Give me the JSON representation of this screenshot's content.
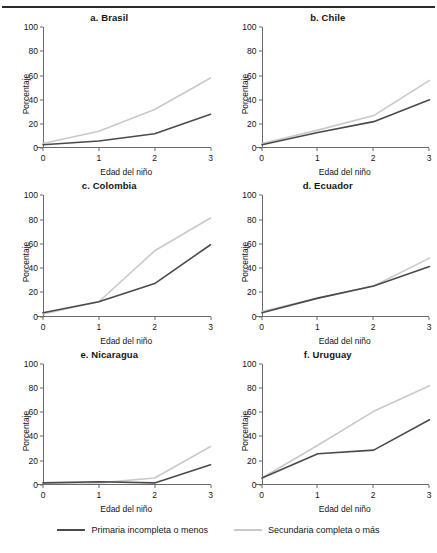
{
  "figure": {
    "ylabel": "Porcentaje",
    "xlabel": "Edad del niño",
    "yticks": [
      "0",
      "20",
      "40",
      "60",
      "80",
      "100"
    ],
    "xticks": [
      "0",
      "1",
      "2",
      "3"
    ]
  },
  "legend": {
    "items": [
      {
        "label": "Primaria incompleta o menos",
        "color": "#4a4a4a"
      },
      {
        "label": "Secundaria completa o más",
        "color": "#c9c9c9"
      }
    ]
  },
  "chart_data": {
    "type": "line",
    "title": "",
    "xlabel": "Edad del niño",
    "ylabel": "Porcentaje",
    "x": [
      0,
      1,
      2,
      3
    ],
    "xlim": [
      0,
      3
    ],
    "ylim": [
      0,
      100
    ],
    "grid": false,
    "legend_position": "bottom",
    "series_names": [
      "Primaria incompleta o menos",
      "Secundaria completa o más"
    ],
    "series_colors": [
      "#4a4a4a",
      "#c9c9c9"
    ],
    "panels": [
      {
        "key": "brasil",
        "title": "a. Brasil",
        "series": [
          {
            "name": "Primaria incompleta o menos",
            "color": "#4a4a4a",
            "values": [
              3,
              6,
              12,
              28
            ]
          },
          {
            "name": "Secundaria completa o más",
            "color": "#c9c9c9",
            "values": [
              4,
              14,
              32,
              58
            ]
          }
        ]
      },
      {
        "key": "chile",
        "title": "b. Chile",
        "series": [
          {
            "name": "Primaria incompleta o menos",
            "color": "#4a4a4a",
            "values": [
              3,
              13,
              22,
              40
            ]
          },
          {
            "name": "Secundaria completa o más",
            "color": "#c9c9c9",
            "values": [
              4,
              15,
              27,
              56
            ]
          }
        ]
      },
      {
        "key": "colombia",
        "title": "c. Colombia",
        "series": [
          {
            "name": "Primaria incompleta o menos",
            "color": "#4a4a4a",
            "values": [
              3,
              12,
              27,
              59
            ]
          },
          {
            "name": "Secundaria completa o más",
            "color": "#c9c9c9",
            "values": [
              2,
              12,
              54,
              81
            ]
          }
        ]
      },
      {
        "key": "ecuador",
        "title": "d. Ecuador",
        "series": [
          {
            "name": "Primaria incompleta o menos",
            "color": "#4a4a4a",
            "values": [
              3,
              15,
              25,
              41
            ]
          },
          {
            "name": "Secundaria completa o más",
            "color": "#c9c9c9",
            "values": [
              4,
              15,
              25,
              48
            ]
          }
        ]
      },
      {
        "key": "nicaragua",
        "title": "e. Nicaragua",
        "series": [
          {
            "name": "Primaria incompleta o menos",
            "color": "#4a4a4a",
            "values": [
              2,
              3,
              2,
              17
            ]
          },
          {
            "name": "Secundaria completa o más",
            "color": "#c9c9c9",
            "values": [
              2,
              2,
              6,
              32
            ]
          }
        ]
      },
      {
        "key": "uruguay",
        "title": "f. Uruguay",
        "series": [
          {
            "name": "Primaria incompleta o menos",
            "color": "#4a4a4a",
            "values": [
              6,
              26,
              29,
              54
            ]
          },
          {
            "name": "Secundaria completa o más",
            "color": "#c9c9c9",
            "values": [
              6,
              33,
              61,
              82
            ]
          }
        ]
      }
    ]
  }
}
